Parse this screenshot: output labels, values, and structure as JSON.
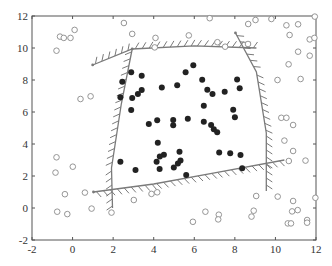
{
  "chart_data": {
    "type": "scatter",
    "title": "",
    "xlabel": "",
    "ylabel": "",
    "xlim": [
      -2,
      12
    ],
    "ylim": [
      -2,
      12
    ],
    "grid": false,
    "legend": null,
    "x_ticks": [
      -2,
      0,
      2,
      4,
      6,
      8,
      10,
      12
    ],
    "y_ticks": [
      -2,
      0,
      2,
      4,
      6,
      8,
      10,
      12
    ],
    "x_tick_labels": [
      "-2",
      "0",
      "2",
      "4",
      "6",
      "8",
      "10",
      "12"
    ],
    "y_tick_labels": [
      "-2",
      "0",
      "2",
      "4",
      "6",
      "8",
      "10",
      "12"
    ],
    "series": [
      {
        "name": "filled (inside class)",
        "marker": "filled-circle",
        "color": "#222222",
        "points": [
          [
            2.89,
            8.48
          ],
          [
            3.41,
            8.27
          ],
          [
            2.45,
            7.89
          ],
          [
            4.4,
            7.54
          ],
          [
            5.16,
            7.67
          ],
          [
            3.41,
            7.38
          ],
          [
            3.22,
            7.13
          ],
          [
            2.94,
            6.88
          ],
          [
            2.36,
            6.92
          ],
          [
            2.89,
            6.13
          ],
          [
            5.95,
            8.92
          ],
          [
            5.57,
            8.48
          ],
          [
            6.39,
            8.02
          ],
          [
            8.11,
            8.04
          ],
          [
            8.24,
            7.48
          ],
          [
            6.64,
            7.39
          ],
          [
            6.9,
            7.13
          ],
          [
            7.5,
            7.27
          ],
          [
            6.47,
            6.39
          ],
          [
            7.92,
            6.14
          ],
          [
            8.0,
            5.67
          ],
          [
            3.76,
            5.25
          ],
          [
            4.17,
            5.48
          ],
          [
            4.96,
            5.5
          ],
          [
            4.96,
            5.17
          ],
          [
            4.2,
            4.08
          ],
          [
            4.5,
            3.33
          ],
          [
            4.3,
            3.21
          ],
          [
            4.14,
            2.89
          ],
          [
            2.36,
            2.89
          ],
          [
            3.1,
            2.38
          ],
          [
            4.29,
            2.44
          ],
          [
            4.99,
            2.54
          ],
          [
            5.19,
            2.79
          ],
          [
            5.27,
            3.52
          ],
          [
            5.68,
            5.58
          ],
          [
            6.47,
            5.39
          ],
          [
            6.83,
            5.19
          ],
          [
            6.96,
            4.92
          ],
          [
            7.13,
            4.73
          ],
          [
            5.32,
            2.96
          ],
          [
            5.6,
            2.06
          ],
          [
            7.23,
            3.46
          ],
          [
            7.77,
            3.42
          ],
          [
            8.28,
            3.31
          ],
          [
            8.36,
            2.48
          ]
        ]
      },
      {
        "name": "open (outside class)",
        "marker": "open-circle",
        "color": "#888888",
        "points": [
          [
            -0.79,
            9.83
          ],
          [
            -0.62,
            10.71
          ],
          [
            -0.43,
            10.63
          ],
          [
            -0.1,
            10.63
          ],
          [
            0.1,
            11.13
          ],
          [
            0.39,
            6.81
          ],
          [
            0.89,
            6.98
          ],
          [
            2.53,
            11.56
          ],
          [
            2.94,
            10.88
          ],
          [
            4.09,
            10.63
          ],
          [
            4.05,
            10.04
          ],
          [
            5.73,
            10.79
          ],
          [
            6.76,
            11.86
          ],
          [
            7.14,
            10.36
          ],
          [
            7.52,
            10.08
          ],
          [
            8.65,
            10.25
          ],
          [
            8.66,
            11.5
          ],
          [
            9.02,
            11.75
          ],
          [
            9.8,
            11.81
          ],
          [
            10.54,
            11.42
          ],
          [
            11.12,
            11.48
          ],
          [
            10.7,
            10.81
          ],
          [
            11.94,
            11.96
          ],
          [
            11.69,
            10.54
          ],
          [
            11.92,
            10.63
          ],
          [
            11.12,
            9.77
          ],
          [
            11.69,
            9.52
          ],
          [
            10.65,
            8.98
          ],
          [
            10.1,
            8.0
          ],
          [
            11.24,
            8.06
          ],
          [
            10.29,
            5.64
          ],
          [
            10.54,
            5.64
          ],
          [
            10.87,
            5.19
          ],
          [
            -0.79,
            3.17
          ],
          [
            -0.84,
            2.21
          ],
          [
            0.01,
            2.58
          ],
          [
            -0.38,
            0.86
          ],
          [
            0.61,
            0.96
          ],
          [
            -0.76,
            -0.23
          ],
          [
            -0.26,
            -0.38
          ],
          [
            0.94,
            -0.04
          ],
          [
            1.92,
            -0.29
          ],
          [
            3.02,
            0.5
          ],
          [
            3.89,
            0.88
          ],
          [
            4.17,
            0.98
          ],
          [
            10.44,
            4.21
          ],
          [
            10.87,
            3.56
          ],
          [
            10.66,
            2.94
          ],
          [
            11.48,
            2.96
          ],
          [
            9.05,
            0.75
          ],
          [
            10.11,
            0.71
          ],
          [
            10.87,
            0.44
          ],
          [
            10.82,
            -0.21
          ],
          [
            11.1,
            -0.13
          ],
          [
            10.61,
            -0.96
          ],
          [
            10.77,
            -0.96
          ],
          [
            11.56,
            -0.75
          ],
          [
            11.56,
            -0.92
          ],
          [
            11.97,
            0.64
          ],
          [
            6.55,
            -0.23
          ],
          [
            7.21,
            -0.42
          ],
          [
            7.18,
            -0.71
          ],
          [
            8.93,
            -0.17
          ],
          [
            8.82,
            -0.54
          ],
          [
            5.93,
            -0.86
          ]
        ]
      }
    ],
    "boundaries": [
      {
        "name": "top boundary",
        "hatch_side": "outside",
        "points": [
          [
            0.99,
            8.94
          ],
          [
            2.94,
            9.94
          ],
          [
            6.0,
            10.13
          ],
          [
            9.06,
            10.0
          ]
        ]
      },
      {
        "name": "left boundary",
        "hatch_side": "outside",
        "points": [
          [
            2.94,
            9.94
          ],
          [
            2.4,
            6.5
          ],
          [
            1.92,
            2.5
          ],
          [
            1.97,
            0.0
          ]
        ]
      },
      {
        "name": "right boundary",
        "hatch_side": "outside",
        "points": [
          [
            8.03,
            10.94
          ],
          [
            9.06,
            8.5
          ],
          [
            9.55,
            4.69
          ],
          [
            9.55,
            1.06
          ]
        ]
      },
      {
        "name": "bottom boundary",
        "hatch_side": "outside",
        "points": [
          [
            1.03,
            1.0
          ],
          [
            4.0,
            1.5
          ],
          [
            7.0,
            2.2
          ],
          [
            10.44,
            3.0
          ]
        ]
      }
    ]
  },
  "colors": {
    "axis": "#555555",
    "filled_marker": "#222222",
    "open_marker": "#8a8a8a",
    "boundary": "#7a7a7a",
    "background": "#ffffff"
  }
}
